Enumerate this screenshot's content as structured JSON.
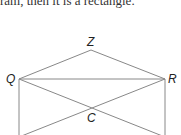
{
  "caption": "ram, then it is a rectangle.",
  "diagram": {
    "points": {
      "Q": {
        "label": "Q",
        "x": 19,
        "y": 79
      },
      "R": {
        "label": "R",
        "x": 165,
        "y": 79
      },
      "Z": {
        "label": "Z",
        "x": 91,
        "y": 50
      },
      "C": {
        "label": "C",
        "x": 92,
        "y": 108
      }
    },
    "stroke_color": "#888888"
  }
}
